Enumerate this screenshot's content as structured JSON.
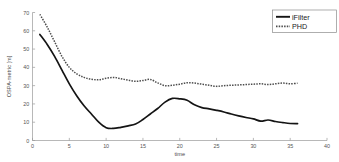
{
  "chart_data": {
    "type": "line",
    "title": "",
    "xlabel": "time",
    "ylabel": "OSPA-metric [m]",
    "xlim": [
      0,
      40
    ],
    "ylim": [
      0,
      70
    ],
    "grid": false,
    "legend_position": "top-right",
    "xticks": [
      "0",
      "5",
      "10",
      "15",
      "20",
      "25",
      "30",
      "35",
      "40"
    ],
    "xtick_values": [
      0,
      5,
      10,
      15,
      20,
      25,
      30,
      35,
      40
    ],
    "yticks": [
      "0",
      "10",
      "20",
      "30",
      "40",
      "50",
      "60",
      "70"
    ],
    "ytick_values": [
      0,
      10,
      20,
      30,
      40,
      50,
      60,
      70
    ],
    "x": [
      1,
      2,
      3,
      4,
      5,
      6,
      7,
      8,
      9,
      10,
      11,
      12,
      13,
      14,
      15,
      16,
      17,
      18,
      19,
      20,
      21,
      22,
      23,
      24,
      25,
      26,
      27,
      28,
      29,
      30,
      31,
      32,
      33,
      34,
      35,
      36
    ],
    "series": [
      {
        "name": "iFilter",
        "style": "solid",
        "color": "#141414",
        "values": [
          58.0,
          52.5,
          46.0,
          38.5,
          31.0,
          24.5,
          19.0,
          14.5,
          10.0,
          7.0,
          6.6,
          7.2,
          8.0,
          9.0,
          11.5,
          14.5,
          17.5,
          21.0,
          23.0,
          22.8,
          22.0,
          19.5,
          18.0,
          17.3,
          16.5,
          15.6,
          14.5,
          13.5,
          12.6,
          11.8,
          10.6,
          11.2,
          10.4,
          9.8,
          9.3,
          9.2
        ]
      },
      {
        "name": "PHD",
        "style": "dotted",
        "color": "#4d4d4d",
        "values": [
          69.0,
          62.0,
          54.0,
          46.0,
          40.0,
          36.5,
          34.5,
          33.5,
          33.2,
          34.0,
          34.5,
          33.8,
          33.0,
          32.4,
          32.8,
          33.4,
          31.5,
          30.0,
          30.2,
          30.8,
          31.6,
          31.4,
          30.8,
          30.2,
          29.6,
          30.0,
          30.2,
          30.4,
          30.6,
          30.8,
          31.0,
          30.6,
          31.0,
          31.4,
          31.0,
          31.3
        ]
      }
    ]
  },
  "legend": {
    "entries": [
      {
        "label": "iFilter"
      },
      {
        "label": "PHD"
      }
    ]
  }
}
